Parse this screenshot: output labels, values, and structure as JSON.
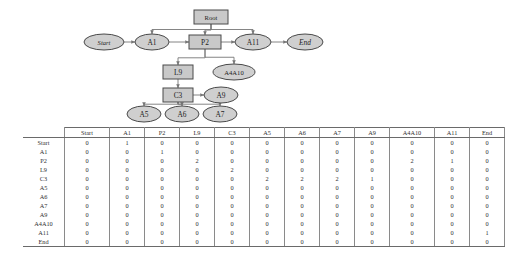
{
  "diagram": {
    "colors": {
      "node_fill": "#c9c9c9",
      "node_stroke": "#4a4a4a",
      "edge": "#777777"
    },
    "nodes": [
      {
        "id": "root",
        "label": "Root",
        "shape": "rect",
        "style": "normal",
        "cx": 211,
        "cy": 17,
        "w": 34,
        "h": 14
      },
      {
        "id": "start",
        "label": "Start",
        "shape": "ellipse",
        "style": "italic",
        "cx": 104,
        "cy": 42,
        "w": 40,
        "h": 16
      },
      {
        "id": "a1",
        "label": "A1",
        "shape": "ellipse",
        "style": "normal",
        "cx": 152,
        "cy": 42,
        "w": 34,
        "h": 16
      },
      {
        "id": "p2",
        "label": "P2",
        "shape": "rect",
        "style": "normal",
        "cx": 205,
        "cy": 42,
        "w": 32,
        "h": 14
      },
      {
        "id": "a11",
        "label": "A11",
        "shape": "ellipse",
        "style": "normal",
        "cx": 253,
        "cy": 42,
        "w": 36,
        "h": 16
      },
      {
        "id": "end",
        "label": "End",
        "shape": "ellipse",
        "style": "italic",
        "cx": 305,
        "cy": 42,
        "w": 36,
        "h": 16
      },
      {
        "id": "l9",
        "label": "L9",
        "shape": "rect",
        "style": "normal",
        "cx": 178,
        "cy": 72,
        "w": 30,
        "h": 14
      },
      {
        "id": "a4a10",
        "label": "A4A10",
        "shape": "ellipse",
        "style": "normal",
        "cx": 234,
        "cy": 72,
        "w": 42,
        "h": 16
      },
      {
        "id": "c3",
        "label": "C3",
        "shape": "rect",
        "style": "normal",
        "cx": 178,
        "cy": 95,
        "w": 30,
        "h": 14
      },
      {
        "id": "a9",
        "label": "A9",
        "shape": "ellipse",
        "style": "normal",
        "cx": 221,
        "cy": 95,
        "w": 34,
        "h": 16
      },
      {
        "id": "a5",
        "label": "A5",
        "shape": "ellipse",
        "style": "normal",
        "cx": 144,
        "cy": 114,
        "w": 34,
        "h": 16
      },
      {
        "id": "a6",
        "label": "A6",
        "shape": "ellipse",
        "style": "normal",
        "cx": 182,
        "cy": 114,
        "w": 34,
        "h": 16
      },
      {
        "id": "a7",
        "label": "A7",
        "shape": "ellipse",
        "style": "normal",
        "cx": 220,
        "cy": 114,
        "w": 34,
        "h": 16
      }
    ],
    "edges": [
      {
        "from": "start",
        "to": "a1"
      },
      {
        "from": "a1",
        "to": "p2"
      },
      {
        "from": "p2",
        "to": "a11"
      },
      {
        "from": "a11",
        "to": "end"
      },
      {
        "from": "root",
        "to": "a1"
      },
      {
        "from": "root",
        "to": "p2"
      },
      {
        "from": "root",
        "to": "a11"
      },
      {
        "from": "p2",
        "to": "l9"
      },
      {
        "from": "p2",
        "to": "a4a10"
      },
      {
        "from": "l9",
        "to": "c3"
      },
      {
        "from": "c3",
        "to": "a9"
      },
      {
        "from": "c3",
        "to": "a5"
      },
      {
        "from": "c3",
        "to": "a6"
      },
      {
        "from": "c3",
        "to": "a7"
      }
    ]
  },
  "matrix": {
    "corner_label": "",
    "columns": [
      "Start",
      "A1",
      "P2",
      "L9",
      "C3",
      "A5",
      "A6",
      "A7",
      "A9",
      "A4A10",
      "A11",
      "End"
    ],
    "rows": [
      {
        "label": "Start",
        "values": [
          0,
          1,
          0,
          0,
          0,
          0,
          0,
          0,
          0,
          0,
          0,
          0
        ]
      },
      {
        "label": "A1",
        "values": [
          0,
          0,
          1,
          0,
          0,
          0,
          0,
          0,
          0,
          0,
          0,
          0
        ]
      },
      {
        "label": "P2",
        "values": [
          0,
          0,
          0,
          2,
          0,
          0,
          0,
          0,
          0,
          2,
          1,
          0
        ]
      },
      {
        "label": "L9",
        "values": [
          0,
          0,
          0,
          0,
          2,
          0,
          0,
          0,
          0,
          0,
          0,
          0
        ]
      },
      {
        "label": "C3",
        "values": [
          0,
          0,
          0,
          0,
          0,
          2,
          2,
          2,
          1,
          0,
          0,
          0
        ]
      },
      {
        "label": "A5",
        "values": [
          0,
          0,
          0,
          0,
          0,
          0,
          0,
          0,
          0,
          0,
          0,
          0
        ]
      },
      {
        "label": "A6",
        "values": [
          0,
          0,
          0,
          0,
          0,
          0,
          0,
          0,
          0,
          0,
          0,
          0
        ]
      },
      {
        "label": "A7",
        "values": [
          0,
          0,
          0,
          0,
          0,
          0,
          0,
          0,
          0,
          0,
          0,
          0
        ]
      },
      {
        "label": "A9",
        "values": [
          0,
          0,
          0,
          0,
          0,
          0,
          0,
          0,
          0,
          0,
          0,
          0
        ]
      },
      {
        "label": "A4A10",
        "values": [
          0,
          0,
          0,
          0,
          0,
          0,
          0,
          0,
          0,
          0,
          0,
          0
        ]
      },
      {
        "label": "A11",
        "values": [
          0,
          0,
          0,
          0,
          0,
          0,
          0,
          0,
          0,
          0,
          0,
          1
        ]
      },
      {
        "label": "End",
        "values": [
          0,
          0,
          0,
          0,
          0,
          0,
          0,
          0,
          0,
          0,
          0,
          0
        ]
      }
    ]
  }
}
